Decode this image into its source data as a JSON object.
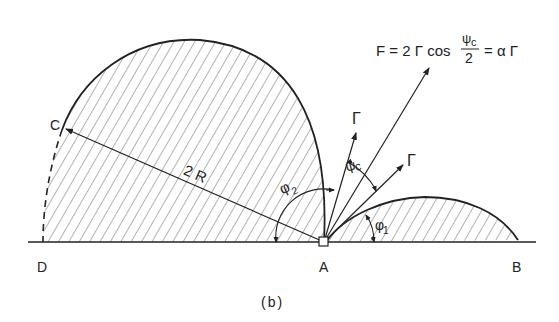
{
  "figure": {
    "caption": "(b)",
    "points": {
      "A": "A",
      "B": "B",
      "C": "C",
      "D": "D"
    },
    "labels": {
      "radius": "2 R",
      "phi1": "φ",
      "phi1_sub": "1",
      "phi2": "φ",
      "phi2_sub": "2",
      "psi": "ψ",
      "psi_sub": "c",
      "gamma_upper": "Γ",
      "gamma_right": "Γ"
    },
    "equation": {
      "lhs": "F = 2 Γ cos",
      "frac_num": "ψ",
      "frac_num_sub": "c",
      "frac_den": "2",
      "rhs": "= α Γ"
    },
    "colors": {
      "ink": "#222222",
      "hatch": "#555555",
      "background": "#ffffff"
    }
  }
}
